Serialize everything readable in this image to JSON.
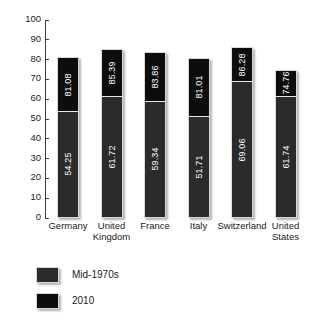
{
  "chart_data": {
    "type": "bar",
    "stacked": true,
    "title": "",
    "subtitle": "",
    "xlabel": "",
    "ylabel": "",
    "ylim": [
      0,
      100
    ],
    "yticks": [
      0,
      10,
      20,
      30,
      40,
      50,
      60,
      70,
      80,
      90,
      100
    ],
    "ytick_labels": [
      "0",
      "10",
      "20",
      "30",
      "40",
      "50",
      "60",
      "70",
      "80",
      "90",
      "100"
    ],
    "grid": false,
    "legend_position": "bottom-left",
    "categories": [
      "Germany",
      "United\nKingdom",
      "France",
      "Italy",
      "Switzerland",
      "United\nStates"
    ],
    "series": [
      {
        "name": "Mid-1970s",
        "color": "#2b2b2b",
        "values": [
          54.25,
          61.72,
          59.34,
          51.71,
          69.06,
          61.74
        ],
        "labels": [
          "54.25",
          "61.72",
          "59.34",
          "51.71",
          "69.06",
          "61.74"
        ]
      },
      {
        "name": "2010",
        "color": "#0d0d0d",
        "values": [
          81.08,
          85.39,
          83.86,
          81.01,
          86.28,
          74.76
        ],
        "labels": [
          "81.08",
          "85.39",
          "83.86",
          "81.01",
          "86.28",
          "74.76"
        ]
      }
    ]
  },
  "legend": {
    "items": [
      {
        "label": "Mid-1970s",
        "color": "#2b2b2b"
      },
      {
        "label": "2010",
        "color": "#0d0d0d"
      }
    ]
  }
}
